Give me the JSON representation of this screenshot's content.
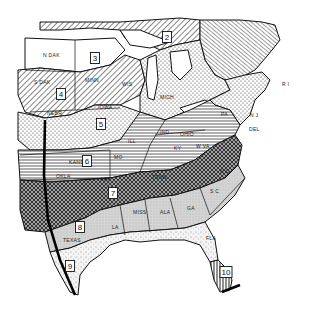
{
  "map": {
    "title": "",
    "region": "Eastern United States",
    "colors": {
      "ink": "#111111",
      "paper": "#ffffff",
      "shade": "#d8d8d8"
    },
    "zones": [
      {
        "id": "2",
        "label": "2",
        "x": 167,
        "y": 37
      },
      {
        "id": "3",
        "label": "3",
        "x": 95,
        "y": 58
      },
      {
        "id": "4",
        "label": "4",
        "x": 61,
        "y": 94
      },
      {
        "id": "5",
        "label": "5",
        "x": 101,
        "y": 124
      },
      {
        "id": "6",
        "label": "6",
        "x": 87,
        "y": 161
      },
      {
        "id": "7",
        "label": "7",
        "x": 113,
        "y": 193
      },
      {
        "id": "8",
        "label": "8",
        "x": 80,
        "y": 227
      },
      {
        "id": "9",
        "label": "9",
        "x": 70,
        "y": 266
      },
      {
        "id": "10",
        "label": "10",
        "x": 226,
        "y": 272
      }
    ],
    "state_labels": [
      {
        "text": "N DAK",
        "x": 43,
        "y": 57
      },
      {
        "text": "S DAK",
        "x": 34,
        "y": 84
      },
      {
        "text": "MINN",
        "x": 85,
        "y": 82
      },
      {
        "text": "WIS",
        "x": 122,
        "y": 86
      },
      {
        "text": "IOWA",
        "x": 98,
        "y": 109
      },
      {
        "text": "NEBR",
        "x": 47,
        "y": 115
      },
      {
        "text": "MICH",
        "x": 160,
        "y": 99
      },
      {
        "text": "ILL",
        "x": 128,
        "y": 143
      },
      {
        "text": "IND",
        "x": 160,
        "y": 134
      },
      {
        "text": "OHIO",
        "x": 180,
        "y": 136
      },
      {
        "text": "PA",
        "x": 221,
        "y": 116
      },
      {
        "text": "N J",
        "x": 250,
        "y": 117
      },
      {
        "text": "DEL",
        "x": 249,
        "y": 131
      },
      {
        "text": "R I",
        "x": 282,
        "y": 86
      },
      {
        "text": "W VA",
        "x": 196,
        "y": 148
      },
      {
        "text": "KY",
        "x": 174,
        "y": 150
      },
      {
        "text": "KANS",
        "x": 69,
        "y": 164
      },
      {
        "text": "MO",
        "x": 114,
        "y": 159
      },
      {
        "text": "OKLA",
        "x": 56,
        "y": 178
      },
      {
        "text": "ARK",
        "x": 100,
        "y": 181
      },
      {
        "text": "TENN",
        "x": 152,
        "y": 179
      },
      {
        "text": "N C",
        "x": 220,
        "y": 173
      },
      {
        "text": "S C",
        "x": 210,
        "y": 193
      },
      {
        "text": "MISS",
        "x": 133,
        "y": 214
      },
      {
        "text": "ALA",
        "x": 160,
        "y": 214
      },
      {
        "text": "GA",
        "x": 187,
        "y": 210
      },
      {
        "text": "LA",
        "x": 112,
        "y": 229
      },
      {
        "text": "TEXAS",
        "x": 63,
        "y": 242
      },
      {
        "text": "FLA",
        "x": 206,
        "y": 240
      }
    ]
  }
}
